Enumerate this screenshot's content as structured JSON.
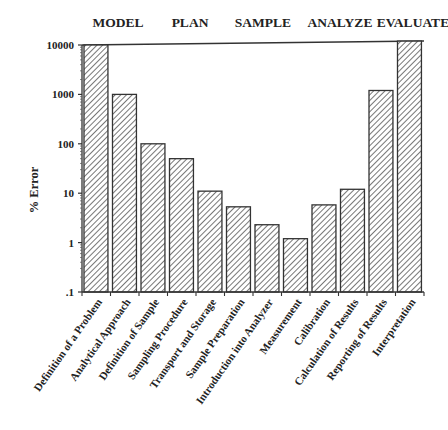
{
  "chart_data": {
    "type": "bar",
    "title": "",
    "xlabel": "",
    "ylabel": "% Error",
    "yscale": "log",
    "ylim": [
      0.1,
      10000
    ],
    "yticks": [
      {
        "value": 10000,
        "label": "10000"
      },
      {
        "value": 1000,
        "label": "1000"
      },
      {
        "value": 100,
        "label": "100"
      },
      {
        "value": 10,
        "label": "10"
      },
      {
        "value": 1,
        "label": "1"
      },
      {
        "value": 0.1,
        "label": ".1"
      }
    ],
    "grid": false,
    "categories": [
      "Definition of a Problem",
      "Analytical Approach",
      "Definition of Sample",
      "Sampling Procedure",
      "Transport and Storage",
      "Sample Preparation",
      "Introduction into Analyzer",
      "Measurement",
      "Calibration",
      "Calculation of Results",
      "Reporting of Results",
      "Interpretation"
    ],
    "values": [
      10000,
      1000,
      100,
      50,
      11,
      5.3,
      2.3,
      1.2,
      5.8,
      12,
      1200,
      12000
    ],
    "phases": [
      "MODEL",
      "PLAN",
      "SAMPLE",
      "ANALYZE",
      "EVALUATE"
    ],
    "bar_fill": "hatched",
    "bar_color": "#333333"
  }
}
